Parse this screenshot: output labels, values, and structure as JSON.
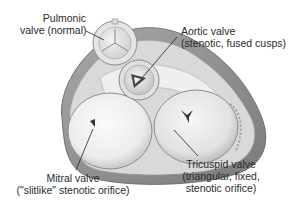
{
  "figure": {
    "style": "grayscale anatomical illustration",
    "colors": {
      "background": "#ffffff",
      "outer_wall": "#8c8c8c",
      "outer_wall_light": "#bdbdbd",
      "annulus": "#e6e6e6",
      "valve_face": "#f2f2f2",
      "valve_shadow": "#c8c8c8",
      "orifice": "#3a3a3a",
      "leader_line": "#222222",
      "text": "#2a2a2a"
    }
  },
  "labels": {
    "pulmonic": {
      "line1": "Pulmonic",
      "line2": "valve (normal)"
    },
    "aortic": {
      "line1": "Aortic valve",
      "line2": "(stenotic, fused cusps)"
    },
    "mitral": {
      "line1": "Mitral valve",
      "line2": "(\"slitlike\" stenotic orifice)"
    },
    "tricuspid": {
      "line1": "Tricuspid valve",
      "line2": "(triangular, fixed,",
      "line3": "stenotic orifice)"
    }
  }
}
